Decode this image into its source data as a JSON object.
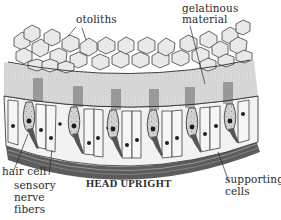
{
  "diagram": {
    "caption": "HEAD UPRIGHT",
    "labels": {
      "otoliths": "otoliths",
      "gelatinous_1": "gelatinous",
      "gelatinous_2": "material",
      "hair_cell": "hair cell",
      "sensory_1": "sensory",
      "sensory_2": "nerve",
      "sensory_3": "fibers",
      "supporting_1": "supporting",
      "supporting_2": "cells"
    },
    "colors": {
      "line": "#2a2a2a",
      "otolith_fill": "#e6e6e6",
      "gel_fill": "#d9d9d9",
      "cell_fill": "#f4f4f4",
      "hair_cell_fill": "#cfcfcf",
      "nerve_band": "#5a5a5a"
    }
  }
}
